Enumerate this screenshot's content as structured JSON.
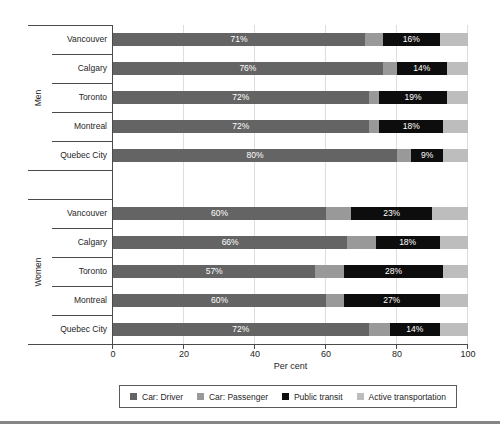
{
  "chart_data": {
    "type": "bar",
    "orientation": "horizontal",
    "stacked": true,
    "title": "",
    "xlabel": "Per cent",
    "xlim": [
      0,
      100
    ],
    "x_ticks": [
      0,
      20,
      40,
      60,
      80,
      100
    ],
    "grid": "vertical",
    "legend_position": "bottom",
    "series_names": [
      "Car: Driver",
      "Car: Passenger",
      "Public transit",
      "Active transportation"
    ],
    "series_colors": [
      "#646464",
      "#999999",
      "#0d0d0d",
      "#bdbdbd"
    ],
    "groups": [
      {
        "label": "Men",
        "rows": [
          {
            "city": "Vancouver",
            "values": [
              71,
              5,
              16,
              8
            ],
            "labels": [
              "71%",
              "",
              "16%",
              ""
            ]
          },
          {
            "city": "Calgary",
            "values": [
              76,
              4,
              14,
              6
            ],
            "labels": [
              "76%",
              "",
              "14%",
              ""
            ]
          },
          {
            "city": "Toronto",
            "values": [
              72,
              3,
              19,
              6
            ],
            "labels": [
              "72%",
              "",
              "19%",
              ""
            ]
          },
          {
            "city": "Montreal",
            "values": [
              72,
              3,
              18,
              7
            ],
            "labels": [
              "72%",
              "",
              "18%",
              ""
            ]
          },
          {
            "city": "Quebec City",
            "values": [
              80,
              4,
              9,
              7
            ],
            "labels": [
              "80%",
              "",
              "9%",
              ""
            ]
          }
        ]
      },
      {
        "label": "Women",
        "rows": [
          {
            "city": "Vancouver",
            "values": [
              60,
              7,
              23,
              10
            ],
            "labels": [
              "60%",
              "",
              "23%",
              ""
            ]
          },
          {
            "city": "Calgary",
            "values": [
              66,
              8,
              18,
              8
            ],
            "labels": [
              "66%",
              "",
              "18%",
              ""
            ]
          },
          {
            "city": "Toronto",
            "values": [
              57,
              8,
              28,
              7
            ],
            "labels": [
              "57%",
              "",
              "28%",
              ""
            ]
          },
          {
            "city": "Montreal",
            "values": [
              60,
              5,
              27,
              8
            ],
            "labels": [
              "60%",
              "",
              "27%",
              ""
            ]
          },
          {
            "city": "Quebec City",
            "values": [
              72,
              6,
              14,
              8
            ],
            "labels": [
              "72%",
              "",
              "14%",
              ""
            ]
          }
        ]
      }
    ]
  },
  "axis": {
    "xlabel": "Per cent",
    "ticks": [
      "0",
      "20",
      "40",
      "60",
      "80",
      "100"
    ]
  },
  "legend": {
    "items": [
      {
        "label": "Car: Driver",
        "color": "#646464"
      },
      {
        "label": "Car: Passenger",
        "color": "#999999"
      },
      {
        "label": "Public transit",
        "color": "#0d0d0d"
      },
      {
        "label": "Active transportation",
        "color": "#bdbdbd"
      }
    ]
  },
  "colors": {
    "gridline": "#dedede",
    "axis_line": "#4a4a4a",
    "bar_value_text": "#ffffff",
    "bottom_rule": "#858585"
  }
}
